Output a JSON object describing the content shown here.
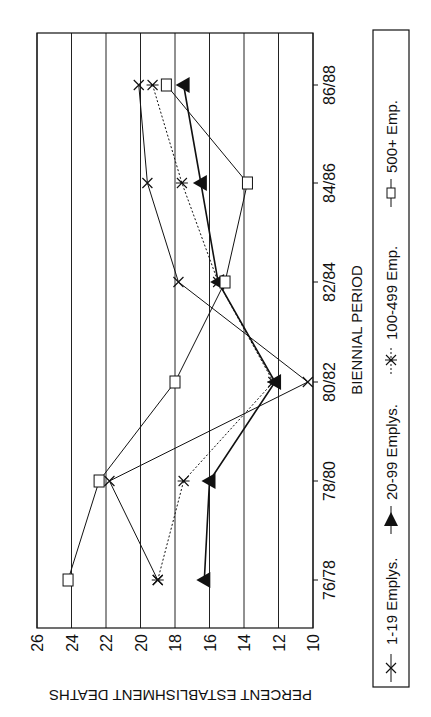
{
  "chart_data": {
    "type": "line",
    "orientation": "rotated-90-clockwise",
    "title": "",
    "xlabel": "BIENNIAL PERIOD",
    "ylabel": "PERCENT ESTABLISHMENT DEATHS",
    "categories": [
      "76/78",
      "78/80",
      "80/82",
      "82/84",
      "84/86",
      "86/88"
    ],
    "y_ticks": [
      10,
      12,
      14,
      16,
      18,
      20,
      22,
      24,
      26
    ],
    "ylim": [
      10,
      26
    ],
    "grid": true,
    "legend_position": "right (rotated, along bottom of upright chart)",
    "series": [
      {
        "name": "1-19 Emplys.",
        "marker": "x",
        "line": "solid",
        "values": [
          19.0,
          21.8,
          10.3,
          17.8,
          19.6,
          20.1
        ]
      },
      {
        "name": "20-99 Emplys.",
        "marker": "triangle",
        "line": "solid-heavy",
        "values": [
          16.3,
          16.0,
          12.2,
          15.5,
          16.5,
          17.5
        ]
      },
      {
        "name": "100-499 Emp.",
        "marker": "asterisk",
        "line": "dotted",
        "values": [
          19.0,
          17.5,
          12.3,
          15.5,
          17.6,
          19.3
        ]
      },
      {
        "name": "500+ Emp.",
        "marker": "square",
        "line": "solid",
        "values": [
          24.2,
          22.4,
          18.0,
          15.1,
          13.8,
          18.5
        ]
      }
    ]
  },
  "axis": {
    "x_title": "BIENNIAL PERIOD",
    "y_title": "PERCENT ESTABLISHMENT DEATHS"
  },
  "legend": {
    "items": [
      {
        "label": "1-19 Emplys."
      },
      {
        "label": "20-99 Emplys."
      },
      {
        "label": "100-499 Emp."
      },
      {
        "label": "500+ Emp."
      }
    ]
  }
}
